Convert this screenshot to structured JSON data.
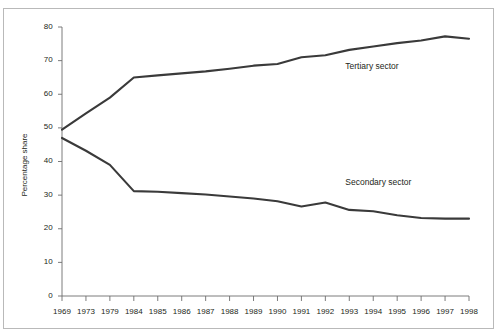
{
  "chart_data": {
    "type": "line",
    "title": "",
    "subtitle": "",
    "xlabel": "",
    "ylabel": "Percentage share",
    "ylim": [
      0,
      80
    ],
    "ytick_step": 10,
    "yticks": [
      0,
      10,
      20,
      30,
      40,
      50,
      60,
      70,
      80
    ],
    "grid": false,
    "legend_position": "inline-annotation",
    "categories": [
      "1969",
      "1973",
      "1979",
      "1984",
      "1985",
      "1986",
      "1987",
      "1988",
      "1989",
      "1990",
      "1991",
      "1992",
      "1993",
      "1994",
      "1995",
      "1996",
      "1997",
      "1998"
    ],
    "series": [
      {
        "name": "Tertiary sector",
        "color": "#3a3a3a",
        "values": [
          49.5,
          54.3,
          59.0,
          65.0,
          65.6,
          66.2,
          66.8,
          67.6,
          68.5,
          69.0,
          71.0,
          71.6,
          73.2,
          74.2,
          75.2,
          76.0,
          77.2,
          76.5
        ]
      },
      {
        "name": "Secondary sector",
        "color": "#3a3a3a",
        "values": [
          47.0,
          43.2,
          39.0,
          31.2,
          31.0,
          30.6,
          30.2,
          29.6,
          29.0,
          28.2,
          26.6,
          27.8,
          25.6,
          25.2,
          24.0,
          23.2,
          23.0,
          23.0
        ]
      }
    ],
    "annotations": [
      {
        "text": "Tertiary sector",
        "x": "1993",
        "y": 68.0
      },
      {
        "text": "Secondary sector",
        "x": "1993",
        "y": 33.5
      }
    ]
  },
  "axis": {
    "y_label": "Percentage share",
    "y_tick_labels": [
      "80",
      "70",
      "60",
      "50",
      "40",
      "30",
      "20",
      "10",
      "0"
    ],
    "x_tick_labels": [
      "1969",
      "1973",
      "1979",
      "1984",
      "1985",
      "1986",
      "1987",
      "1988",
      "1989",
      "1990",
      "1991",
      "1992",
      "1993",
      "1994",
      "1995",
      "1996",
      "1997",
      "1998"
    ]
  },
  "annotations": {
    "tertiary_label": "Tertiary sector",
    "secondary_label": "Secondary sector"
  },
  "style": {
    "line_color": "#3a3a3a",
    "axis_color": "#6d6d6d",
    "frame_color": "#b9b9b9",
    "text_color": "#231f20",
    "background": "#ffffff"
  }
}
